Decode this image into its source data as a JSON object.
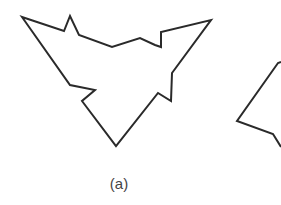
{
  "figure": {
    "caption_a": "(a)",
    "stroke_color": "#2a2a2a",
    "stroke_width": 2,
    "polygon_a_points": "22,17 64,31 70,16 79,35 112,47 140,38 155,45 161,47 161,32 211,20 172,73 171,101 158,93 116,146 82,101 95,90 70,85",
    "polygon_b_points": "281,62 278,63 237,121 273,134 281,147"
  }
}
